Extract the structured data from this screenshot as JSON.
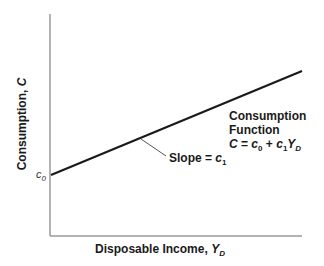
{
  "diagram": {
    "type": "consumption-function",
    "y_axis_label": "Consumption, C",
    "x_axis_label": "Disposable Income, Y_D",
    "intercept_label": "c0",
    "slope_label": "Slope = c1",
    "function_title_line1": "Consumption",
    "function_title_line2": "Function",
    "function_equation": "C = c0 + c1 YD",
    "colors": {
      "axes": "#9a9a9a",
      "line": "#1a1a1a",
      "leader": "#555555",
      "text": "#1a1a1a"
    }
  },
  "labels": {
    "ylabel_main": "Consumption, ",
    "ylabel_var": "C",
    "xlabel_main": "Disposable Income, ",
    "xlabel_var": "Y",
    "xlabel_sub": "D",
    "c0_var": "c",
    "c0_sub": "0",
    "slope_text": "Slope = ",
    "slope_var": "c",
    "slope_sub": "1",
    "func_line1": "Consumption",
    "func_line2": "Function",
    "eq_C": "C",
    "eq_eq": " = ",
    "eq_c0": "c",
    "eq_c0_sub": "0",
    "eq_plus": " + ",
    "eq_c1": "c",
    "eq_c1_sub": "1",
    "eq_Y": "Y",
    "eq_Y_sub": "D"
  }
}
